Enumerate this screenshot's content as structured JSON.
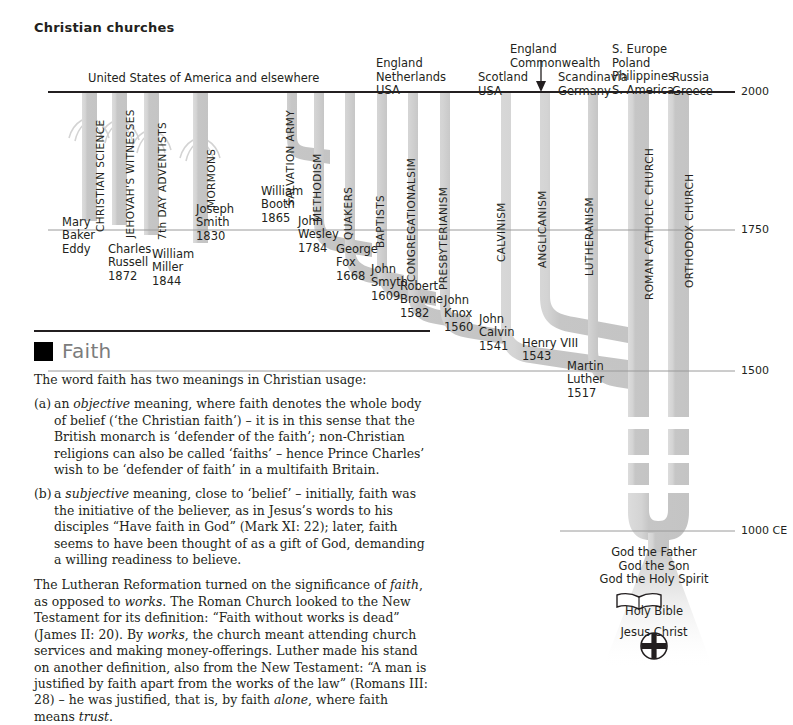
{
  "page": {
    "title": "Christian churches"
  },
  "diagram": {
    "region_headers": [
      {
        "id": "usa-elsewhere",
        "text": "United States of America and elsewhere",
        "x": 88,
        "y": 72
      },
      {
        "id": "england-netherlands-usa",
        "text": "England\nNetherlands\nUSA",
        "x": 376,
        "y": 57
      },
      {
        "id": "scotland-usa",
        "text": "Scotland\nUSA",
        "x": 478,
        "y": 71
      },
      {
        "id": "england-commonwealth",
        "text": "England\nCommonwealth",
        "x": 510,
        "y": 43
      },
      {
        "id": "scandinavia-germany",
        "text": "Scandinavia\nGermany",
        "x": 558,
        "y": 71
      },
      {
        "id": "s-europe-poland-philippines-s-america",
        "text": "S. Europe\nPoland\nPhilippines\nS. America",
        "x": 612,
        "y": 43
      },
      {
        "id": "russia-greece",
        "text": "Russia\nGreece",
        "x": 672,
        "y": 71
      }
    ],
    "timeline": {
      "ticks": [
        {
          "label": "2000",
          "y": 92
        },
        {
          "label": "1750",
          "y": 230
        },
        {
          "label": "1500",
          "y": 371
        },
        {
          "label": "1000 CE",
          "y": 531
        }
      ],
      "axis_x_right": 735,
      "label_x": 741
    },
    "denominations": [
      {
        "name": "CHRISTIAN SCIENCE",
        "x": 89,
        "label_bottom": 232,
        "founder": "Mary\nBaker\nEddy",
        "founder_x": 62,
        "founder_y": 216
      },
      {
        "name": "JEHOVAH'S WITNESSES",
        "x": 119,
        "label_bottom": 238,
        "founder": "Charles\nRussell\n1872",
        "founder_x": 108,
        "founder_y": 243
      },
      {
        "name": "7th DAY ADVENTISTS",
        "x": 151,
        "label_bottom": 240,
        "founder": "William\nMiller\n1844",
        "founder_x": 152,
        "founder_y": 248
      },
      {
        "name": "MORMONS",
        "x": 200,
        "label_bottom": 208,
        "founder": "Joseph\nSmith\n1830",
        "founder_x": 196,
        "founder_y": 203
      },
      {
        "name": "SALVATION ARMY",
        "x": 279,
        "label_bottom": 206,
        "founder": "William\nBooth\n1865",
        "founder_x": 261,
        "founder_y": 185
      },
      {
        "name": "METHODISM",
        "x": 306,
        "label_bottom": 222,
        "founder": "John\nWesley\n1784",
        "founder_x": 298,
        "founder_y": 215
      },
      {
        "name": "QUAKERS",
        "x": 337,
        "label_bottom": 240,
        "founder": "George\nFox\n1668",
        "founder_x": 336,
        "founder_y": 243
      },
      {
        "name": "BAPTISTS",
        "x": 368,
        "label_bottom": 248,
        "founder": "John\nSmyth\n1609",
        "founder_x": 371,
        "founder_y": 263
      },
      {
        "name": "CONGREGATIONALSIM",
        "x": 400,
        "label_bottom": 272,
        "founder": "Robert\nBrowne\n1582",
        "founder_x": 400,
        "founder_y": 280
      },
      {
        "name": "PRESBYTERIANISM",
        "x": 432,
        "label_bottom": 280,
        "founder": "John\nKnox\n1560",
        "founder_x": 444,
        "founder_y": 294
      },
      {
        "name": "CALVINISM",
        "x": 490,
        "label_bottom": 258,
        "founder": "John\nCalvin\n1541",
        "founder_x": 479,
        "founder_y": 313
      },
      {
        "name": "ANGLICANISM",
        "x": 531,
        "label_bottom": 265,
        "founder": "Henry VIII\n1543",
        "founder_x": 522,
        "founder_y": 337
      },
      {
        "name": "LUTHERANISM",
        "x": 578,
        "label_bottom": 272,
        "founder": "Martin\nLuther\n1517",
        "founder_x": 567,
        "founder_y": 360
      },
      {
        "name": "ROMAN CATHOLIC CHURCH",
        "x": 638,
        "label_bottom": 288,
        "founder": "",
        "founder_x": 0,
        "founder_y": 0
      },
      {
        "name": "ORTHODOX CHURCH",
        "x": 678,
        "label_bottom": 279,
        "founder": "",
        "founder_x": 0,
        "founder_y": 0
      }
    ],
    "trinity_text": "God the Father\nGod the Son\nGod the Holy Spirit",
    "symbols": [
      {
        "icon": "open-book-icon",
        "caption": "Holy Bible"
      },
      {
        "icon": "latin-cross-in-circle-icon",
        "caption": "Jesus Christ"
      }
    ],
    "colors": {
      "band_fill": "#c8c8c8",
      "band_highlight": "#d9d9d9",
      "band_edge": "#b0b0b0",
      "axis": "#231f20",
      "tick_line": "#7b7b7b"
    }
  },
  "faith": {
    "heading": "Faith",
    "intro": "The word faith has two meanings in Christian usage:",
    "items": [
      {
        "marker": "(a)",
        "text_html": "an <i>objective</i> meaning, where faith denotes the whole body of belief (&lsquo;the Christian faith&rsquo;) &ndash; it is in this sense that the British monarch is &lsquo;defender of the faith&rsquo;; non-Christian religions can also be called &lsquo;faiths&rsquo; &ndash; hence Prince Charles&rsquo; wish to be &lsquo;defender of faith&rsquo; in a multifaith Britain."
      },
      {
        "marker": "(b)",
        "text_html": "a <i>subjective</i> meaning, close to &lsquo;belief&rsquo; &ndash; initially, faith was the initiative of the believer, as in Jesus&rsquo;s words to his disciples &ldquo;Have faith in God&rdquo; (Mark XI: 22); later, faith seems to have been thought of as a gift of God, demanding a willing readiness to believe."
      }
    ],
    "closing_html": "The Lutheran Reformation turned on the significance of <i>faith</i>, as opposed to <i>works</i>. The Roman Church looked to the New Testament for its definition: &ldquo;Faith without works is dead&rdquo; (James II: 20). By <i>works</i>, the church meant attending church services and making money-offerings. Luther made his stand on another definition, also from the New Testament: &ldquo;A man is justified by faith apart from the works of the law&rdquo; (Romans III: 28) &ndash; he was justified, that is, by faith <i>alone</i>, where faith means <i>trust</i>."
  }
}
